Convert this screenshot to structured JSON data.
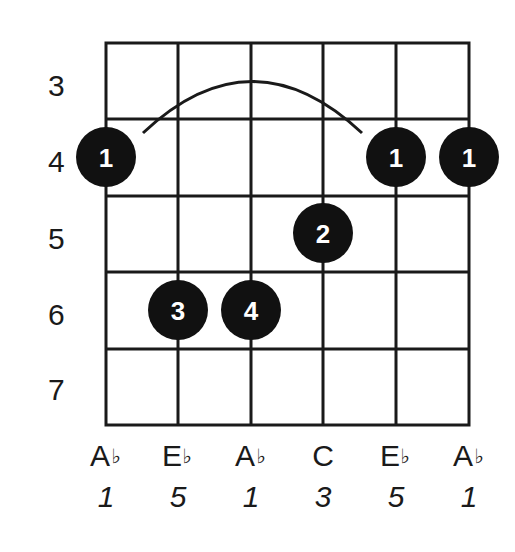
{
  "chord_diagram": {
    "description": "Guitar chord fingering diagram, barre at fret 4",
    "frets": [
      "3",
      "4",
      "5",
      "6",
      "7"
    ],
    "strings": [
      {
        "note": "A",
        "accidental": "♭",
        "interval": "1"
      },
      {
        "note": "E",
        "accidental": "♭",
        "interval": "5"
      },
      {
        "note": "A",
        "accidental": "♭",
        "interval": "1"
      },
      {
        "note": "C",
        "accidental": "",
        "interval": "3"
      },
      {
        "note": "E",
        "accidental": "♭",
        "interval": "5"
      },
      {
        "note": "A",
        "accidental": "♭",
        "interval": "1"
      }
    ],
    "fingers": [
      {
        "string": 1,
        "fret": 4,
        "label": "1"
      },
      {
        "string": 2,
        "fret": 6,
        "label": "3"
      },
      {
        "string": 3,
        "fret": 6,
        "label": "4"
      },
      {
        "string": 4,
        "fret": 5,
        "label": "2"
      },
      {
        "string": 5,
        "fret": 4,
        "label": "1"
      },
      {
        "string": 6,
        "fret": 4,
        "label": "1"
      }
    ],
    "barre": {
      "fret": 4,
      "from_string": 1,
      "to_string": 5,
      "label": "barre-arc"
    },
    "colors": {
      "line": "#1a1a1a",
      "dot": "#111111",
      "dot_text": "#ffffff",
      "background": "#ffffff"
    }
  }
}
